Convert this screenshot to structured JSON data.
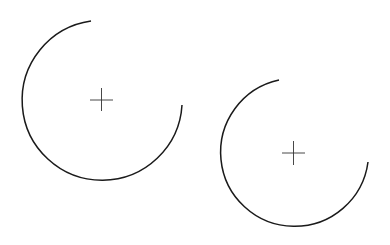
{
  "canvas": {
    "width": 390,
    "height": 245,
    "background": "#ffffff"
  },
  "stroke_color": "#1a1a1a",
  "arcs": [
    {
      "id": "arc-1",
      "cx": 101,
      "cy": 100,
      "r": 80,
      "start": [
        91,
        21
      ],
      "end": [
        182,
        105
      ],
      "cross_size": 12
    },
    {
      "id": "arc-2",
      "cx": 293,
      "cy": 153,
      "r": 74,
      "start": [
        279,
        80
      ],
      "end": [
        368,
        162
      ],
      "cross_size": 12
    }
  ]
}
